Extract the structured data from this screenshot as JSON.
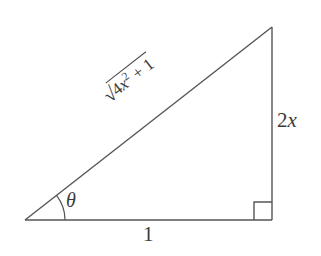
{
  "figure": {
    "kind": "right-triangle-diagram",
    "background_color": "#ffffff",
    "stroke_color": "#555555",
    "text_color": "#3a3a3a",
    "labels": {
      "base": "1",
      "opposite": "2x",
      "opposite_coefficient": "2",
      "opposite_variable": "x",
      "angle": "θ",
      "hypotenuse_radical_sign": "√",
      "hypotenuse_radicand_coefficient": "4",
      "hypotenuse_radicand_variable": "x",
      "hypotenuse_radicand_exponent": "2",
      "hypotenuse_radicand_tail": "+ 1",
      "right_angle_marker": "right-angle"
    },
    "geometry": {
      "vertex_left": "25,220",
      "vertex_right": "272,220",
      "vertex_apex": "272,27",
      "angle_arc_radius": "40",
      "right_angle_size": "18"
    }
  }
}
